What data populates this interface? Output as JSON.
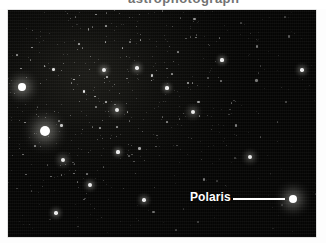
{
  "page": {
    "background_color": "#ffffff",
    "width": 326,
    "height": 243,
    "cropped_caption_fragment": "astrophotograph"
  },
  "photo": {
    "kind": "astronomical-photograph",
    "subject": "north celestial pole star field",
    "background_color": "#040403",
    "border_color": "#c8c8c8",
    "frame": {
      "x": 8,
      "y": 10,
      "width": 308,
      "height": 227
    }
  },
  "annotation": {
    "label": "Polaris",
    "label_color": "#ffffff",
    "leader_line_color": "#ffffff",
    "leader_line": {
      "x": 233,
      "y": 198,
      "length": 52
    },
    "target_star": {
      "x": 293,
      "y": 199,
      "name": "Polaris",
      "brightness": "brightest-right"
    }
  },
  "stars": {
    "bright": [
      {
        "x": 22,
        "y": 87,
        "r": 4.0,
        "glow": 11
      },
      {
        "x": 45,
        "y": 131,
        "r": 5.0,
        "glow": 14
      },
      {
        "x": 293,
        "y": 199,
        "r": 4.2,
        "glow": 12
      }
    ],
    "medium": [
      {
        "x": 117,
        "y": 110,
        "r": 2.4,
        "glow": 7
      },
      {
        "x": 193,
        "y": 112,
        "r": 2.0,
        "glow": 6
      },
      {
        "x": 250,
        "y": 157,
        "r": 2.0,
        "glow": 6
      },
      {
        "x": 63,
        "y": 160,
        "r": 2.2,
        "glow": 6
      },
      {
        "x": 90,
        "y": 185,
        "r": 1.9,
        "glow": 5
      },
      {
        "x": 144,
        "y": 200,
        "r": 1.7,
        "glow": 5
      },
      {
        "x": 104,
        "y": 70,
        "r": 1.9,
        "glow": 5
      },
      {
        "x": 137,
        "y": 68,
        "r": 1.8,
        "glow": 5
      },
      {
        "x": 167,
        "y": 88,
        "r": 1.6,
        "glow": 4
      },
      {
        "x": 222,
        "y": 60,
        "r": 1.6,
        "glow": 4
      },
      {
        "x": 302,
        "y": 70,
        "r": 1.7,
        "glow": 5
      },
      {
        "x": 56,
        "y": 213,
        "r": 1.7,
        "glow": 5
      },
      {
        "x": 118,
        "y": 152,
        "r": 1.6,
        "glow": 4
      }
    ]
  }
}
